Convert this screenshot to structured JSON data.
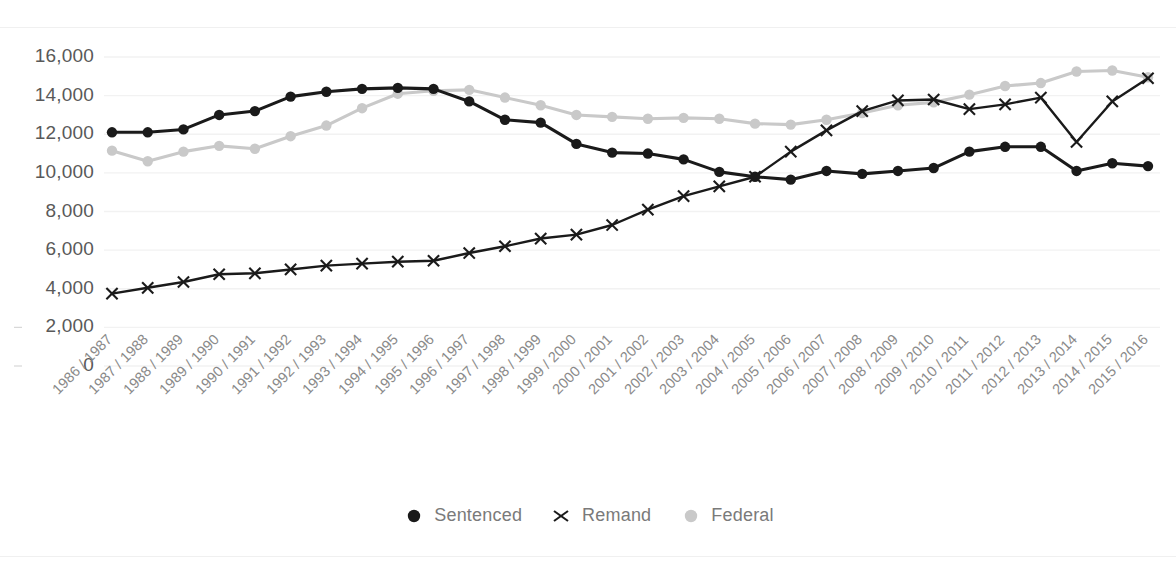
{
  "chart_data": {
    "type": "line",
    "title": "",
    "xlabel": "",
    "ylabel": "",
    "ylim": [
      0,
      16000
    ],
    "ytick_step": 2000,
    "grid": true,
    "grid_axis": "y",
    "legend_position": "bottom",
    "ytick_labels": [
      "16,000",
      "14,000",
      "12,000",
      "10,000",
      "8,000",
      "6,000",
      "4,000",
      "2,000",
      "0"
    ],
    "yticks": [
      16000,
      14000,
      12000,
      10000,
      8000,
      6000,
      4000,
      2000,
      0
    ],
    "categories": [
      "1986 / 1987",
      "1987 / 1988",
      "1988 / 1989",
      "1989 / 1990",
      "1990 / 1991",
      "1991 / 1992",
      "1992 / 1993",
      "1993 / 1994",
      "1994 / 1995",
      "1995 / 1996",
      "1996 / 1997",
      "1997 / 1998",
      "1998 / 1999",
      "1999 / 2000",
      "2000 / 2001",
      "2001 / 2002",
      "2002 / 2003",
      "2003 / 2004",
      "2004 / 2005",
      "2005 / 2006",
      "2006 / 2007",
      "2007 / 2008",
      "2008 / 2009",
      "2009 / 2010",
      "2010 / 2011",
      "2011 / 2012",
      "2012 / 2013",
      "2013 / 2014",
      "2014 / 2015",
      "2015 / 2016"
    ],
    "series": [
      {
        "name": "Sentenced",
        "color": "#1a1a1a",
        "marker": "circle",
        "values": [
          12100,
          12100,
          12250,
          13000,
          13200,
          13950,
          14200,
          14350,
          14400,
          14350,
          13700,
          12750,
          12600,
          11500,
          11050,
          11000,
          10700,
          10050,
          9800,
          9650,
          10100,
          9950,
          10100,
          10250,
          11100,
          11350,
          11350,
          10100,
          10500,
          10350
        ]
      },
      {
        "name": "Remand",
        "color": "#1a1a1a",
        "marker": "x",
        "values": [
          3750,
          4050,
          4350,
          4750,
          4800,
          5000,
          5200,
          5300,
          5400,
          5450,
          5850,
          6200,
          6600,
          6800,
          7300,
          8100,
          8800,
          9300,
          9800,
          11100,
          12200,
          13200,
          13750,
          13800,
          13300,
          13550,
          13900,
          11600,
          13700,
          14900
        ]
      },
      {
        "name": "Federal",
        "color": "#c9c9c9",
        "marker": "circle",
        "values": [
          11150,
          10600,
          11100,
          11400,
          11250,
          11900,
          12450,
          13350,
          14100,
          14250,
          14300,
          13900,
          13500,
          13000,
          12900,
          12800,
          12850,
          12800,
          12550,
          12500,
          12750,
          13100,
          13500,
          13650,
          14050,
          14500,
          14650,
          15250,
          15300,
          14950
        ]
      }
    ]
  },
  "legend": {
    "items": [
      {
        "label": "Sentenced",
        "marker": "circle",
        "color": "#1a1a1a"
      },
      {
        "label": "Remand",
        "marker": "x",
        "color": "#1a1a1a"
      },
      {
        "label": "Federal",
        "marker": "circle",
        "color": "#c9c9c9"
      }
    ]
  }
}
